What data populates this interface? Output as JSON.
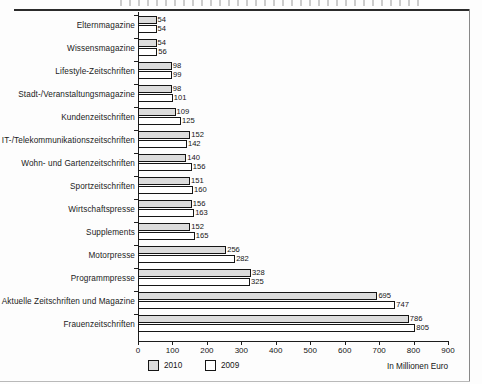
{
  "chart_data": {
    "type": "bar",
    "orientation": "horizontal",
    "title": "",
    "xlabel": "In Millionen Euro",
    "ylabel": "",
    "xlim": [
      0,
      900
    ],
    "xticks": [
      0,
      100,
      200,
      300,
      400,
      500,
      600,
      700,
      800,
      900
    ],
    "grid": false,
    "legend_position": "bottom-left",
    "categories": [
      "Elternmagazine",
      "Wissensmagazine",
      "Lifestyle-Zeitschriften",
      "Stadt-/Veranstaltungsmagazine",
      "Kundenzeitschriften",
      "IT-/Telekommunikationszeitschriften",
      "Wohn- und Gartenzeitschriften",
      "Sportzeitschriften",
      "Wirtschaftspresse",
      "Supplements",
      "Motorpresse",
      "Programmpresse",
      "Aktuelle Zeitschriften und Magazine",
      "Frauenzeitschriften"
    ],
    "series": [
      {
        "name": "2010",
        "color": "#dcdcdc",
        "values": [
          54,
          54,
          98,
          98,
          109,
          152,
          140,
          151,
          156,
          152,
          256,
          328,
          695,
          786
        ]
      },
      {
        "name": "2009",
        "color": "#ffffff",
        "values": [
          54,
          56,
          99,
          101,
          125,
          142,
          156,
          160,
          163,
          165,
          282,
          325,
          747,
          805
        ]
      }
    ]
  },
  "legend": {
    "items": [
      {
        "label": "2010",
        "swatch": "s2010"
      },
      {
        "label": "2009",
        "swatch": "s2009"
      }
    ]
  },
  "axis_note": "In Millionen Euro"
}
